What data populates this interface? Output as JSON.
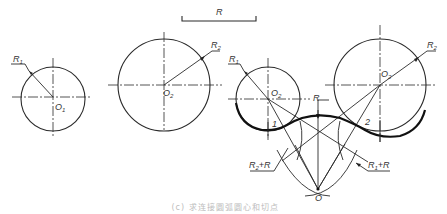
{
  "figure": {
    "type": "geometric construction: arc tangent externally/internally connecting two circles",
    "labels": {
      "r_bar": "R",
      "left_circle_radius": "R",
      "left_circle_radius_sub": "1",
      "left_circle_center": "O",
      "left_circle_center_sub": "1",
      "mid_circle_radius": "R",
      "mid_circle_radius_sub": "2",
      "mid_circle_center": "O",
      "mid_circle_center_sub": "2",
      "right_small_radius": "R",
      "right_small_radius_sub": "1",
      "right_small_center": "O",
      "right_small_center_sub": "2",
      "right_large_radius": "R",
      "right_large_radius_sub": "2",
      "right_large_center": "O",
      "right_large_center_sub": "2",
      "arc_radius": "R",
      "tangent_point_1": "1",
      "tangent_point_2": "2",
      "sum_left": "R",
      "sum_left_sub": "2",
      "sum_left_tail": "+R",
      "sum_right": "R",
      "sum_right_sub": "1",
      "sum_right_tail": "+R",
      "origin": "O"
    },
    "caption": "(c) 求连接圆弧圆心和切点"
  },
  "colors": {
    "line": "#2a2a2a",
    "thick_line": "#111111",
    "caption": "#bdbdbd"
  }
}
